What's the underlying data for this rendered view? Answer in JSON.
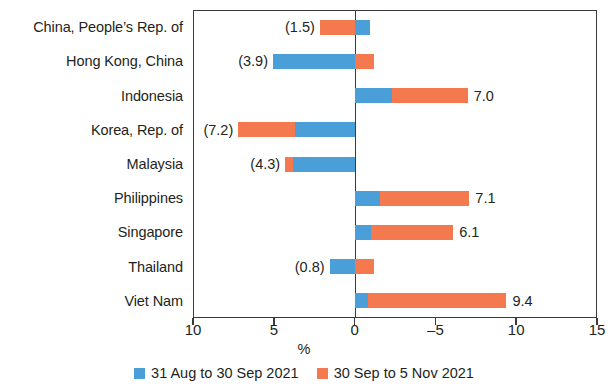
{
  "chart_data": {
    "type": "bar",
    "orientation": "horizontal",
    "stacked": true,
    "title": "",
    "xlabel": "%",
    "ylabel": "",
    "grid": false,
    "axis_note": "Axis is reversed: values increase to the left of zero.",
    "xlim": [
      10,
      15
    ],
    "xticks": [
      10,
      5,
      0,
      -5,
      10,
      15
    ],
    "xtick_labels": [
      "10",
      "5",
      "0",
      "–5",
      "10",
      "15"
    ],
    "categories": [
      "China, People’s Rep. of",
      "Hong Kong, China",
      "Indonesia",
      "Korea, Rep. of",
      "Malaysia",
      "Philippines",
      "Singapore",
      "Thailand",
      "Viet Nam"
    ],
    "series": [
      {
        "name": "31 Aug to 30 Sep 2021",
        "color": "#4a9fd8",
        "values": [
          -0.9,
          3.9,
          2.3,
          3.7,
          3.8,
          1.6,
          1.0,
          1.5,
          0.8
        ]
      },
      {
        "name": "30 Sep to 5 Nov 2021",
        "color": "#f4794e",
        "values": [
          2.4,
          -1.3,
          4.7,
          3.5,
          0.5,
          5.5,
          5.1,
          -0.7,
          8.6
        ]
      }
    ],
    "totals": [
      -1.5,
      3.9,
      7.0,
      7.2,
      4.3,
      7.1,
      6.1,
      0.8,
      9.4
    ],
    "data_labels": [
      {
        "category": "China, People’s Rep. of",
        "text": "(1.5)",
        "side": "left"
      },
      {
        "category": "Hong Kong, China",
        "text": "(3.9)",
        "side": "left"
      },
      {
        "category": "Indonesia",
        "text": "7.0",
        "side": "right"
      },
      {
        "category": "Korea, Rep. of",
        "text": "(7.2)",
        "side": "left"
      },
      {
        "category": "Malaysia",
        "text": "(4.3)",
        "side": "left"
      },
      {
        "category": "Philippines",
        "text": "7.1",
        "side": "right"
      },
      {
        "category": "Singapore",
        "text": "6.1",
        "side": "right"
      },
      {
        "category": "Thailand",
        "text": "(0.8)",
        "side": "left"
      },
      {
        "category": "Viet Nam",
        "text": "9.4",
        "side": "right"
      }
    ],
    "legend": {
      "position": "bottom-center",
      "entries": [
        {
          "label": "31 Aug to 30 Sep 2021",
          "color": "#4a9fd8"
        },
        {
          "label": "30 Sep to 5 Nov 2021",
          "color": "#f4794e"
        }
      ]
    },
    "bar_segments_px": [
      {
        "category": "China, People’s Rep. of",
        "segments": [
          {
            "series": 1,
            "left_units": 2.15,
            "right_units": 0.0
          },
          {
            "series": 0,
            "left_units": 0.0,
            "right_units": -0.95
          }
        ]
      },
      {
        "category": "Hong Kong, China",
        "segments": [
          {
            "series": 0,
            "left_units": 5.05,
            "right_units": 0.0
          },
          {
            "series": 1,
            "left_units": 0.0,
            "right_units": -1.2
          }
        ]
      },
      {
        "category": "Indonesia",
        "segments": [
          {
            "series": 0,
            "left_units": 0.0,
            "right_units": -2.3
          },
          {
            "series": 1,
            "left_units": -2.3,
            "right_units": -7.0
          }
        ]
      },
      {
        "category": "Korea, Rep. of",
        "segments": [
          {
            "series": 1,
            "left_units": 7.2,
            "right_units": 3.7
          },
          {
            "series": 0,
            "left_units": 3.7,
            "right_units": 0.0
          }
        ]
      },
      {
        "category": "Malaysia",
        "segments": [
          {
            "series": 1,
            "left_units": 4.3,
            "right_units": 3.8
          },
          {
            "series": 0,
            "left_units": 3.8,
            "right_units": 0.0
          }
        ]
      },
      {
        "category": "Philippines",
        "segments": [
          {
            "series": 0,
            "left_units": 0.0,
            "right_units": -1.6
          },
          {
            "series": 1,
            "left_units": -1.6,
            "right_units": -7.1
          }
        ]
      },
      {
        "category": "Singapore",
        "segments": [
          {
            "series": 0,
            "left_units": 0.0,
            "right_units": -1.0
          },
          {
            "series": 1,
            "left_units": -1.0,
            "right_units": -6.1
          }
        ]
      },
      {
        "category": "Thailand",
        "segments": [
          {
            "series": 0,
            "left_units": 1.55,
            "right_units": 0.0
          },
          {
            "series": 1,
            "left_units": 0.0,
            "right_units": -1.2
          }
        ]
      },
      {
        "category": "Viet Nam",
        "segments": [
          {
            "series": 0,
            "left_units": 0.0,
            "right_units": -0.8
          },
          {
            "series": 1,
            "left_units": -0.8,
            "right_units": -9.4
          }
        ]
      }
    ]
  }
}
